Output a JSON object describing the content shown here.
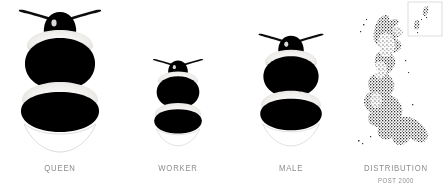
{
  "plate": {
    "title": "Bumblebee castes and distribution",
    "background_color": "#ffffff",
    "caption_color": "#8d8d8d",
    "body_color": "#000000",
    "band_color": "#f2f0ed",
    "tail_color": "#ffffff",
    "map_color": "#3a3a3a"
  },
  "panels": [
    {
      "id": "queen",
      "label": "QUEEN",
      "sublabel": "",
      "type": "bee",
      "scale": 1.0,
      "center_x": 60,
      "description": "Large queen bumblebee, dorsal view, black body with pale collar and abdominal bands and white tail"
    },
    {
      "id": "worker",
      "label": "WORKER",
      "sublabel": "",
      "type": "bee",
      "scale": 0.63,
      "center_x": 178,
      "description": "Small worker bumblebee, dorsal view, same banding pattern as queen at reduced size"
    },
    {
      "id": "male",
      "label": "MALE",
      "sublabel": "",
      "type": "bee",
      "scale": 0.85,
      "center_x": 289,
      "description": "Male bumblebee, dorsal view, intermediate size with pale collar and abdominal bands"
    },
    {
      "id": "distribution",
      "label": "DISTRIBUTION",
      "sublabel": "POST 2000",
      "type": "map",
      "scale": 1.0,
      "center_x": 397,
      "description": "Stippled dot distribution map of Great Britain with inset box for northern isles"
    }
  ],
  "bee_anatomy": {
    "parts": [
      "antenna-left",
      "antenna-right",
      "head",
      "collar-band",
      "thorax",
      "thorax-band",
      "abdomen-band",
      "tail"
    ]
  },
  "map": {
    "inset_label": "",
    "inset_present": true,
    "regions": [
      "Great Britain",
      "Northern Isles inset"
    ]
  }
}
